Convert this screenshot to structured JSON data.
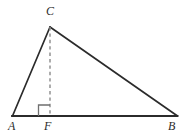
{
  "figure": {
    "type": "geometry-diagram",
    "width": 192,
    "height": 137,
    "background_color": "#ffffff",
    "stroke_color": "#2b2b2b",
    "dashed_stroke_color": "#8a8a8a",
    "labels": {
      "a": "A",
      "b": "B",
      "c": "C",
      "f": "F"
    },
    "points": {
      "A": {
        "x": 12,
        "y": 116
      },
      "B": {
        "x": 177,
        "y": 116
      },
      "C": {
        "x": 50,
        "y": 27
      },
      "F": {
        "x": 50,
        "y": 116
      }
    },
    "segments": [
      {
        "name": "AB",
        "from": "A",
        "to": "B",
        "style": "solid"
      },
      {
        "name": "AC",
        "from": "A",
        "to": "C",
        "style": "solid"
      },
      {
        "name": "CB",
        "from": "C",
        "to": "B",
        "style": "solid"
      },
      {
        "name": "CF",
        "from": "C",
        "to": "F",
        "style": "dashed"
      }
    ],
    "right_angle_marker": {
      "at": "F",
      "size": 11,
      "orientation": "left-of-altitude"
    }
  }
}
